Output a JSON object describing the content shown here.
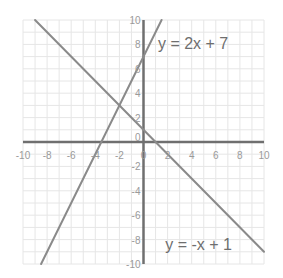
{
  "chart_data": {
    "type": "line",
    "title": "",
    "xlabel": "",
    "ylabel": "",
    "xlim": [
      -10,
      10
    ],
    "ylim": [
      -10,
      10
    ],
    "grid": true,
    "grid_step": 1,
    "x_ticks": [
      -10,
      -8,
      -6,
      -4,
      -2,
      0,
      2,
      4,
      6,
      8,
      10
    ],
    "y_ticks": [
      -10,
      -8,
      -6,
      -4,
      -2,
      0,
      2,
      4,
      6,
      8,
      10
    ],
    "x_tick_labels": [
      "-10",
      "-8",
      "-6",
      "-4",
      "-2",
      "0",
      "2",
      "4",
      "6",
      "8",
      "10"
    ],
    "y_tick_labels": [
      "-10",
      "-8",
      "-6",
      "-4",
      "-2",
      "0",
      "2",
      "4",
      "6",
      "8",
      "10"
    ],
    "series": [
      {
        "name": "y = 2x + 7",
        "slope": 2,
        "intercept": 7,
        "x": [
          -8.5,
          1.5
        ],
        "y": [
          -10,
          10
        ]
      },
      {
        "name": "y = -x + 1",
        "slope": -1,
        "intercept": 1,
        "x": [
          -9,
          10
        ],
        "y": [
          10,
          -9
        ]
      }
    ],
    "annotations": [
      {
        "text": "y = 2x + 7",
        "x": 1.2,
        "y": 8.1
      },
      {
        "text": "y = -x + 1",
        "x": 1.8,
        "y": -8.4
      }
    ],
    "intersection": {
      "x": -2,
      "y": 3
    }
  },
  "colors": {
    "background": "#ffffff",
    "grid": "#e6e6e6",
    "axis": "#6f6f6f",
    "line": "#8a8a8a",
    "tick_text": "#9a9a9a",
    "equation_text": "#6e6e6e"
  }
}
